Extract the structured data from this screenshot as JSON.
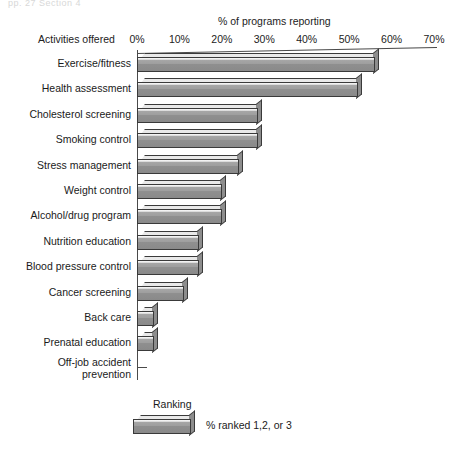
{
  "header": {
    "cut_off_text": "pp. 27    Section 4"
  },
  "chart_data": {
    "type": "bar",
    "orientation": "horizontal",
    "title": "% of programs reporting",
    "xlabel": "% of programs reporting",
    "ylabel": "Activities offered",
    "xlim": [
      0,
      70
    ],
    "xticks": [
      "0%",
      "10%",
      "20%",
      "30%",
      "40%",
      "50%",
      "60%",
      "70%"
    ],
    "xtick_values": [
      0,
      10,
      20,
      30,
      40,
      50,
      60,
      70
    ],
    "grid": false,
    "categories": [
      "Exercise/fitness",
      "Health assessment",
      "Cholesterol screening",
      "Smoking control",
      "Stress management",
      "Weight control",
      "Alcohol/drug program",
      "Nutrition education",
      "Blood pressure control",
      "Cancer screening",
      "Back care",
      "Prenatal education",
      "Off-job accident\nprevention"
    ],
    "values": [
      56,
      52,
      28.5,
      28.5,
      24,
      20,
      20,
      14.5,
      14.5,
      11,
      4,
      4,
      0
    ],
    "series": [
      {
        "name": "% ranked 1,2, or 3",
        "values": [
          56,
          52,
          28.5,
          28.5,
          24,
          20,
          20,
          14.5,
          14.5,
          11,
          4,
          4,
          0
        ]
      }
    ],
    "legend": {
      "title": "Ranking",
      "position": "bottom",
      "entries": [
        "% ranked 1,2, or 3"
      ]
    },
    "colors": {
      "bar_face": "#9a9a9a",
      "bar_top": "#e9e9e9",
      "bar_side": "#8d8d8d",
      "outline": "#3a3a3a",
      "axis": "#4a4a4a",
      "background": "#ffffff"
    }
  }
}
